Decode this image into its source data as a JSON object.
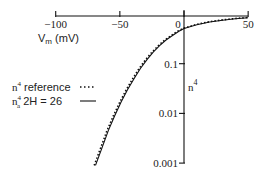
{
  "chart_data": {
    "type": "line",
    "title": "",
    "xlabel": "V_m (mV)",
    "ylabel": "n^4",
    "xlim": [
      -100,
      50
    ],
    "ylim": [
      0.001,
      1
    ],
    "yscale": "log",
    "x_ticks": [
      -100,
      -50,
      0,
      50
    ],
    "x_tick_labels": [
      "-100",
      "-50",
      "0",
      "50"
    ],
    "y_ticks": [
      0.1,
      0.01,
      0.001
    ],
    "y_tick_labels": [
      "0.1",
      "0.01",
      "0.001"
    ],
    "grid": false,
    "legend_position": "left-middle",
    "series": [
      {
        "name": "n^4 reference",
        "style": "dotted",
        "x": [
          -70,
          -65,
          -60,
          -55,
          -50,
          -45,
          -40,
          -35,
          -30,
          -25,
          -20,
          -15,
          -10,
          -5,
          0,
          10,
          20,
          30,
          40,
          50
        ],
        "y": [
          0.0009,
          0.002,
          0.0045,
          0.009,
          0.017,
          0.03,
          0.05,
          0.08,
          0.12,
          0.17,
          0.23,
          0.3,
          0.37,
          0.45,
          0.52,
          0.62,
          0.7,
          0.76,
          0.81,
          0.85
        ]
      },
      {
        "name": "n_a^4 2H = 26",
        "style": "solid",
        "x": [
          -69,
          -64,
          -59,
          -54,
          -49,
          -44,
          -39,
          -34,
          -29,
          -24,
          -19,
          -14,
          -9,
          -4,
          0,
          10,
          20,
          30,
          40,
          50
        ],
        "y": [
          0.0009,
          0.002,
          0.0045,
          0.009,
          0.017,
          0.03,
          0.05,
          0.08,
          0.12,
          0.17,
          0.23,
          0.3,
          0.37,
          0.45,
          0.51,
          0.61,
          0.69,
          0.75,
          0.8,
          0.84
        ]
      }
    ]
  },
  "labels": {
    "xlabel_main": "V",
    "xlabel_sub": "m",
    "xlabel_unit": " (mV)",
    "ylabel_main": "n",
    "ylabel_sup": "4",
    "legend": [
      {
        "main": "n",
        "sup": "4",
        "sub": "",
        "text": " reference"
      },
      {
        "main": "n",
        "sup": "4",
        "sub": "a",
        "text": "  2H = 26"
      }
    ]
  },
  "colors": {
    "ink": "#111111",
    "background": "#ffffff"
  }
}
